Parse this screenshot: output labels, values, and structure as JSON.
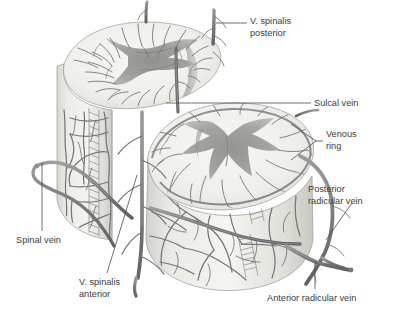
{
  "figure": {
    "background_color": "#ffffff",
    "text_color": "#3c3c3c",
    "leader_color": "#4a4a4a",
    "palette": {
      "white_matter": "#ebebe7",
      "grey_matter": "#9c9c9a",
      "grey_matter_dark": "#8a8a88",
      "vein": "#7e7e7e",
      "vein_dark": "#6b6b6b",
      "cylinder_body": "#e4e4df",
      "cylinder_shadow": "#cfcfc9",
      "outline": "#8d8d8d"
    }
  },
  "labels": [
    {
      "id": "v-spinalis-posterior",
      "text_line1": "V. spinalis",
      "text_line2": "posterior",
      "x": 250,
      "y": 24,
      "anchor": "start"
    },
    {
      "id": "sulcal-vein",
      "text_line1": "Sulcal vein",
      "text_line2": "",
      "x": 314,
      "y": 106,
      "anchor": "start"
    },
    {
      "id": "venous-ring",
      "text_line1": "Venous",
      "text_line2": "ring",
      "x": 326,
      "y": 142,
      "anchor": "start"
    },
    {
      "id": "posterior-radicular-vein",
      "text_line1": "Posterior",
      "text_line2": "radicular vein",
      "x": 308,
      "y": 192,
      "anchor": "start"
    },
    {
      "id": "spinal-vein",
      "text_line1": "Spinal vein",
      "text_line2": "",
      "x": 16,
      "y": 243,
      "anchor": "start"
    },
    {
      "id": "v-spinalis-anterior",
      "text_line1": "V. spinalis",
      "text_line2": "anterior",
      "x": 79,
      "y": 285,
      "anchor": "start"
    },
    {
      "id": "anterior-radicular-vein",
      "text_line1": "Anterior radicular vein",
      "text_line2": "",
      "x": 267,
      "y": 301,
      "anchor": "start"
    }
  ]
}
